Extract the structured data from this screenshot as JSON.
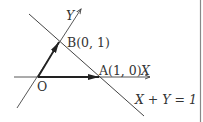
{
  "diagram": {
    "type": "vector-coordinate-diagram",
    "colors": {
      "line": "#444444",
      "vector": "#222222",
      "text": "#333333",
      "frame": "#888888"
    },
    "axes": {
      "x_label": "X",
      "y_label": "Y"
    },
    "points": {
      "origin": {
        "label": "O"
      },
      "A": {
        "label": "A(1, 0)"
      },
      "B": {
        "label": "B(0, 1)"
      }
    },
    "line_label": "X + Y = 1",
    "vectors": [
      "OA",
      "OB"
    ]
  }
}
